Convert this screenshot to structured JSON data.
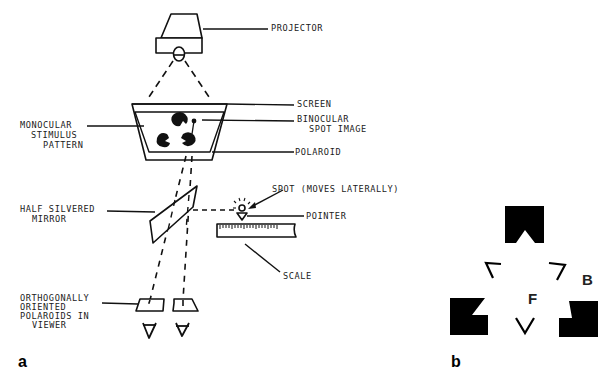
{
  "figure": {
    "panel_a": {
      "panel_label": "a",
      "labels": {
        "projector": "PROJECTOR",
        "screen": "SCREEN",
        "monocular_stimulus": [
          "MONOCULAR",
          "STIMULUS",
          "PATTERN"
        ],
        "binocular_spot": [
          "BINOCULAR",
          "SPOT IMAGE"
        ],
        "polaroid": "POLAROID",
        "spot": "SPOT (MOVES LATERALLY)",
        "pointer": "POINTER",
        "half_silvered_mirror": [
          "HALF SILVERED",
          "MIRROR"
        ],
        "scale": "SCALE",
        "orthogonal_polaroids": [
          "ORTHOGONALLY",
          "ORIENTED",
          "POLAROIDS IN",
          "VIEWER"
        ]
      }
    },
    "panel_b": {
      "panel_label": "b",
      "letters": {
        "background": "B",
        "figure": "F"
      }
    }
  },
  "colors": {
    "ink": "#111111",
    "background": "#ffffff"
  }
}
